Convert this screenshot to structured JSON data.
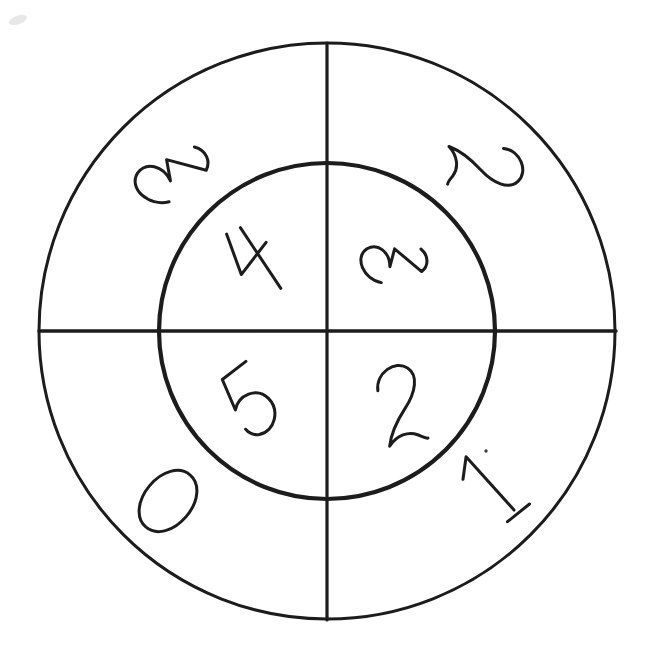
{
  "page": {
    "background_color": "#ffffff",
    "ink_color": "#1c1c1c"
  },
  "diagram": {
    "canvas": {
      "width": 648,
      "height": 653
    },
    "center": {
      "x": 327,
      "y": 331
    },
    "circles": [
      {
        "name": "outer-circle",
        "radius": 288,
        "stroke_width": 3.0
      },
      {
        "name": "inner-circle",
        "radius": 168,
        "stroke_width": 4.2
      }
    ],
    "axes": [
      {
        "name": "horizontal-axis-line",
        "x1": 39,
        "y1": 331,
        "x2": 616,
        "y2": 331,
        "stroke_width": 3.4
      },
      {
        "name": "vertical-axis-line",
        "x1": 327,
        "y1": 43,
        "x2": 327,
        "y2": 620,
        "stroke_width": 3.2
      }
    ],
    "numbers": [
      {
        "name": "outer-ring-number-top-left",
        "value": "3",
        "ring": "outer",
        "quadrant": "top-left",
        "x": 176,
        "y": 176,
        "rotation": -120,
        "scale": 1.45
      },
      {
        "name": "outer-ring-number-top-right",
        "value": "2",
        "ring": "outer",
        "quadrant": "top-right",
        "x": 486,
        "y": 166,
        "rotation": 92,
        "scale": 1.3
      },
      {
        "name": "outer-ring-number-bottom-left",
        "value": "0",
        "ring": "outer",
        "quadrant": "bottom-left",
        "x": 168,
        "y": 501,
        "rotation": 40,
        "scale": 1.14
      },
      {
        "name": "outer-ring-number-bottom-right",
        "value": "1",
        "ring": "outer",
        "quadrant": "bottom-right",
        "x": 490,
        "y": 487,
        "rotation": -44,
        "scale": 1.28
      },
      {
        "name": "inner-circle-number-top-left",
        "value": "4",
        "ring": "inner",
        "quadrant": "top-left",
        "x": 256,
        "y": 258,
        "rotation": -45,
        "scale": 1.3
      },
      {
        "name": "inner-circle-number-top-right",
        "value": "3",
        "ring": "inner",
        "quadrant": "top-right",
        "x": 396,
        "y": 265,
        "rotation": -95,
        "scale": 1.25
      },
      {
        "name": "inner-circle-number-bottom-left",
        "value": "5",
        "ring": "inner",
        "quadrant": "bottom-left",
        "x": 251,
        "y": 404,
        "rotation": -35,
        "scale": 1.35
      },
      {
        "name": "inner-circle-number-bottom-right",
        "value": "2",
        "ring": "inner",
        "quadrant": "bottom-right",
        "x": 400,
        "y": 404,
        "rotation": -12,
        "scale": 1.35
      }
    ],
    "marks": [
      {
        "name": "ink-speck",
        "x": 486,
        "y": 451,
        "radius": 1.7,
        "color": "#2a2a2a",
        "opacity": 0.9
      },
      {
        "name": "paper-smudge",
        "x": 18,
        "y": 20,
        "radius": 6,
        "color": "#c9c9c9",
        "opacity": 0.45
      }
    ]
  }
}
